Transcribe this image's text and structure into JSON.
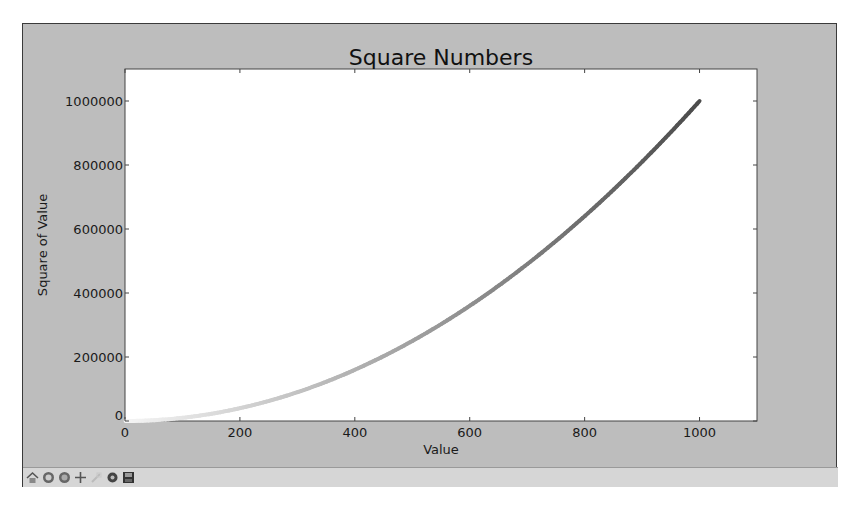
{
  "window": {
    "figure_bg": "#bdbdbd",
    "plot_bg": "#ffffff"
  },
  "toolbar": {
    "buttons": [
      {
        "name": "home-icon",
        "label": "Home"
      },
      {
        "name": "back-icon",
        "label": "Back"
      },
      {
        "name": "forward-icon",
        "label": "Forward"
      },
      {
        "name": "pan-icon",
        "label": "Pan"
      },
      {
        "name": "zoom-icon",
        "label": "Zoom"
      },
      {
        "name": "configure-subplots-icon",
        "label": "Configure subplots"
      },
      {
        "name": "save-icon",
        "label": "Save"
      }
    ]
  },
  "chart_data": {
    "type": "scatter",
    "title": "Square Numbers",
    "xlabel": "Value",
    "ylabel": "Square of Value",
    "xlim": [
      0,
      1100
    ],
    "ylim": [
      0,
      1100000
    ],
    "xticks": [
      0,
      200,
      400,
      600,
      800,
      1000
    ],
    "xtick_labels": [
      "0",
      "200",
      "400",
      "600",
      "800",
      "1000"
    ],
    "yticks": [
      0,
      200000,
      400000,
      600000,
      800000,
      1000000
    ],
    "ytick_labels": [
      "0",
      "200000",
      "400000",
      "600000",
      "800000",
      "1000000"
    ],
    "grid": false,
    "legend": null,
    "colormap": "Greys",
    "series": [
      {
        "name": "squares",
        "x_range": [
          1,
          1000
        ],
        "function": "y = x^2",
        "sample_points": [
          {
            "x": 1,
            "y": 1
          },
          {
            "x": 100,
            "y": 10000
          },
          {
            "x": 200,
            "y": 40000
          },
          {
            "x": 300,
            "y": 90000
          },
          {
            "x": 400,
            "y": 160000
          },
          {
            "x": 500,
            "y": 250000
          },
          {
            "x": 600,
            "y": 360000
          },
          {
            "x": 700,
            "y": 490000
          },
          {
            "x": 800,
            "y": 640000
          },
          {
            "x": 900,
            "y": 810000
          },
          {
            "x": 1000,
            "y": 1000000
          }
        ]
      }
    ]
  }
}
